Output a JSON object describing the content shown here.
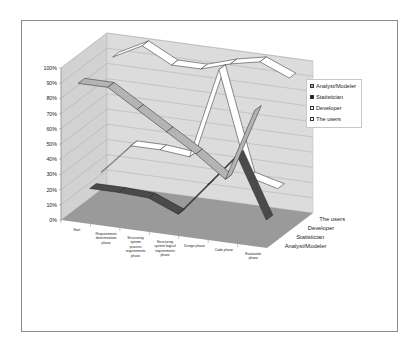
{
  "chart_data": {
    "type": "line",
    "subtype": "3d-line",
    "title": "",
    "xlabel": "",
    "ylabel": "",
    "ylim": [
      0,
      100
    ],
    "y_ticks": [
      "0%",
      "10%",
      "20%",
      "30%",
      "40%",
      "50%",
      "60%",
      "70%",
      "80%",
      "90%",
      "100%"
    ],
    "categories": [
      "Start",
      "Requirements determination phase",
      "Structuring system process requirements phase",
      "Structuring system logical requirements phase",
      "Design phase",
      "Code phase",
      "Evaluation phase"
    ],
    "series_axis_labels": [
      "Analyst/Modeler",
      "Statistician",
      "Developer",
      "The users"
    ],
    "series": [
      {
        "name": "Analyst/Modeler",
        "color": "#b4b4b4",
        "values": [
          90,
          90,
          78,
          66,
          54,
          40,
          88
        ]
      },
      {
        "name": "Statistician",
        "color": "#4a4a4a",
        "values": [
          15,
          15,
          14,
          6,
          28,
          50,
          10
        ]
      },
      {
        "name": "Developer",
        "color": "#ffffff",
        "values": [
          20,
          40,
          40,
          38,
          98,
          30,
          25
        ]
      },
      {
        "name": "The users",
        "color": "#ffffff",
        "values": [
          90,
          100,
          90,
          90,
          96,
          100,
          92
        ]
      }
    ],
    "grid": true,
    "legend_position": "right"
  },
  "x_tick_lines": [
    [
      "Start"
    ],
    [
      "Requirements",
      "determination",
      "phase"
    ],
    [
      "Structuring",
      "system",
      "process",
      "requirements",
      "phase"
    ],
    [
      "Structuring",
      "system logical",
      "requirements",
      "phase"
    ],
    [
      "Design phase"
    ],
    [
      "Code phase"
    ],
    [
      "Evaluation",
      "phase"
    ]
  ],
  "legend": {
    "items": [
      {
        "label": "Analyst/Modeler",
        "color": "#a8a8a8"
      },
      {
        "label": "Statistician",
        "color": "#222222"
      },
      {
        "label": "Developer",
        "color": "#ffffff"
      },
      {
        "label": "The users",
        "color": "#ffffff"
      }
    ]
  },
  "colors": {
    "wall": "#dcdcdc",
    "side_wall": "#d2d2d2",
    "floor": "#9a9a9a",
    "gridline": "#a0a0a0"
  }
}
